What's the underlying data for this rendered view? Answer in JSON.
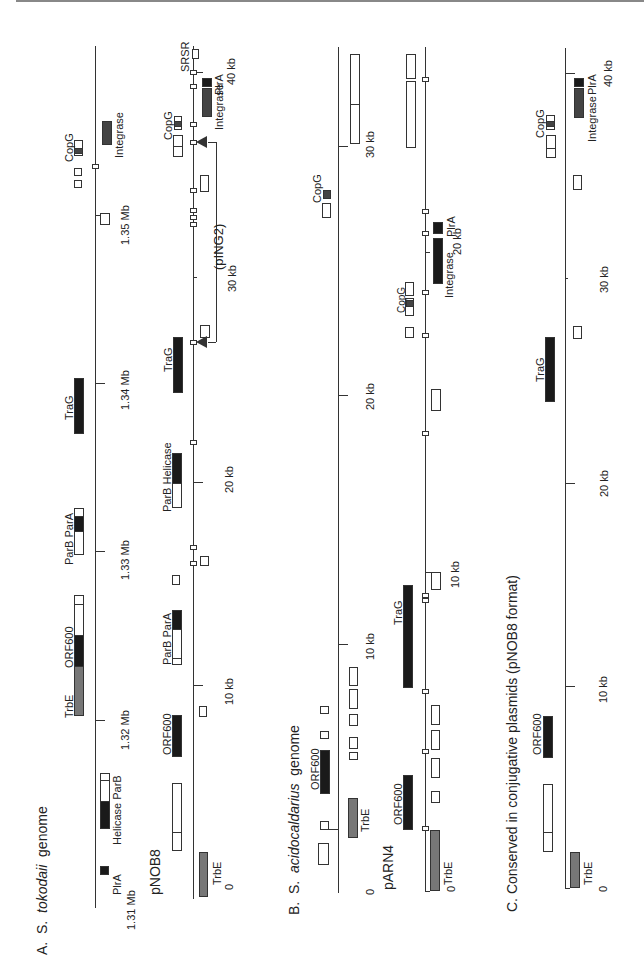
{
  "figure": {
    "panel_a": {
      "title_letter": "A.",
      "title_genus": "S.",
      "title_species": "tokodaii",
      "title_suffix": "genome",
      "genome_track": {
        "ticks": [
          "1.31 Mb",
          "1.32 Mb",
          "1.33 Mb",
          "1.34 Mb",
          "1.35 Mb"
        ],
        "genes": [
          "PlrA",
          "Helicase",
          "ParB",
          "TrbE",
          "ORF600",
          "ParB",
          "ParA",
          "TraG",
          "CopG",
          "Integrase"
        ]
      },
      "pnob8_track": {
        "name": "pNOB8",
        "ticks": [
          "0",
          "10 kb",
          "20 kb",
          "30 kb",
          "40 kb"
        ],
        "genes": [
          "TrbE",
          "ORF600",
          "ParB",
          "ParA",
          "ParB",
          "Helicase",
          "TraG",
          "CopG",
          "Integrase",
          "PlrA",
          "SRSR"
        ],
        "insertion": "(pING2)"
      }
    },
    "panel_b": {
      "title_letter": "B.",
      "title_genus": "S.",
      "title_species": "acidocaldarius",
      "title_suffix": "genome",
      "genome_track": {
        "ticks": [
          "0",
          "10 kb",
          "20 kb",
          "30 kb"
        ],
        "genes": [
          "TrbE",
          "ORF600",
          "CopG"
        ]
      },
      "parn4_track": {
        "name": "pARN4",
        "ticks": [
          "0",
          "10 kb",
          "20 kb"
        ],
        "genes": [
          "TrbE",
          "ORF600",
          "TraG",
          "CopG",
          "Integrase",
          "PlrA"
        ]
      }
    },
    "panel_c": {
      "title": "C. Conserved in conjugative plasmids (pNOB8 format)",
      "ticks": [
        "0",
        "10 kb",
        "20 kb",
        "30 kb",
        "40 kb"
      ],
      "genes": [
        "TrbE",
        "ORF600",
        "TraG",
        "CopG",
        "Integrase",
        "PlrA"
      ]
    },
    "colors": {
      "black_gene": "#1a1a1a",
      "grey_gene": "#777777",
      "dark_grey_gene": "#444444",
      "open_gene": "#ffffff",
      "line": "#333333"
    }
  }
}
